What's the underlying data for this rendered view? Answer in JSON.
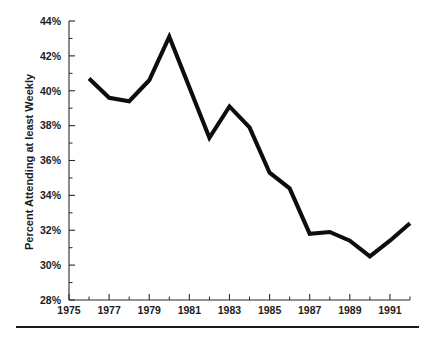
{
  "chart_data": {
    "type": "line",
    "title": "",
    "subtitle": "",
    "xlabel": "",
    "ylabel": "Percent Attending at least Weekly",
    "x": [
      1976,
      1977,
      1978,
      1979,
      1980,
      1981,
      1982,
      1983,
      1984,
      1985,
      1986,
      1987,
      1988,
      1989,
      1990,
      1991,
      1992
    ],
    "values": [
      40.7,
      39.6,
      39.4,
      40.6,
      43.1,
      40.2,
      37.3,
      39.1,
      37.9,
      35.3,
      34.4,
      31.8,
      31.9,
      31.4,
      30.5,
      31.4,
      32.4
    ],
    "series": [
      {
        "name": "Percent Attending at least Weekly",
        "values": [
          40.7,
          39.6,
          39.4,
          40.6,
          43.1,
          40.2,
          37.3,
          39.1,
          37.9,
          35.3,
          34.4,
          31.8,
          31.9,
          31.4,
          30.5,
          31.4,
          32.4
        ]
      }
    ],
    "xlim": [
      1975,
      1992
    ],
    "ylim": [
      28,
      44
    ],
    "y_ticks": [
      28,
      30,
      32,
      34,
      36,
      38,
      40,
      42,
      44
    ],
    "y_tick_labels": [
      "28%",
      "30%",
      "32%",
      "34%",
      "36%",
      "38%",
      "40%",
      "42%",
      "44%"
    ],
    "x_ticks": [
      1975,
      1976,
      1977,
      1978,
      1979,
      1980,
      1981,
      1982,
      1983,
      1984,
      1985,
      1986,
      1987,
      1988,
      1989,
      1990,
      1991,
      1992
    ],
    "x_tick_labels": [
      "1975",
      "",
      "1977",
      "",
      "1979",
      "",
      "1981",
      "",
      "1983",
      "",
      "1985",
      "",
      "1987",
      "",
      "1989",
      "",
      "1991",
      ""
    ],
    "x_labeled_ticks": [
      {
        "year": 1975,
        "label": "1975"
      },
      {
        "year": 1977,
        "label": "1977"
      },
      {
        "year": 1979,
        "label": "1979"
      },
      {
        "year": 1981,
        "label": "1981"
      },
      {
        "year": 1983,
        "label": "1983"
      },
      {
        "year": 1985,
        "label": "1985"
      },
      {
        "year": 1987,
        "label": "1987"
      },
      {
        "year": 1989,
        "label": "1989"
      },
      {
        "year": 1991,
        "label": "1991"
      }
    ],
    "grid": false,
    "legend": "none",
    "line_color": "#0d0d0d",
    "background_color": "#ffffff",
    "axis_color": "#2b2b2b"
  },
  "figure": {
    "footer_rule": true
  }
}
